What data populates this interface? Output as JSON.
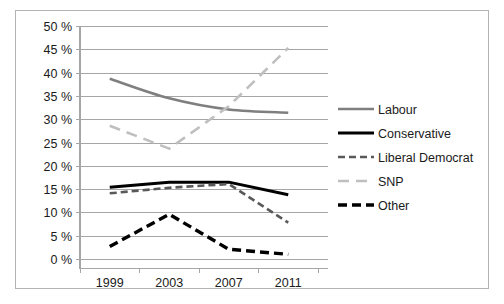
{
  "chart_data": {
    "type": "line",
    "title": "",
    "subtitle": "",
    "xlabel": "",
    "ylabel": "",
    "categories": [
      "1999",
      "2003",
      "2007",
      "2011"
    ],
    "x_tick_labels": [
      "1999",
      "2003",
      "2007",
      "2011"
    ],
    "y_tick_labels": [
      "0 %",
      "5 %",
      "10 %",
      "15 %",
      "20 %",
      "25 %",
      "30 %",
      "35 %",
      "40 %",
      "45 %",
      "50 %"
    ],
    "y_tick_values": [
      0,
      5,
      10,
      15,
      20,
      25,
      30,
      35,
      40,
      45,
      50
    ],
    "ylim": [
      0,
      50
    ],
    "y_tick_step": 5,
    "grid": "horizontal",
    "legend_position": "right",
    "series": [
      {
        "name": "Labour",
        "values": [
          38.8,
          34.6,
          32.2,
          31.5
        ],
        "color": "#7f7f7f",
        "style": "solid",
        "width": 2.6
      },
      {
        "name": "Conservative",
        "values": [
          15.5,
          16.6,
          16.6,
          13.9
        ],
        "color": "#000000",
        "style": "solid",
        "width": 3.0
      },
      {
        "name": "Liberal Democrat",
        "values": [
          14.2,
          15.4,
          16.2,
          7.9
        ],
        "color": "#595959",
        "style": "dashed",
        "width": 2.6
      },
      {
        "name": "SNP",
        "values": [
          28.7,
          23.8,
          32.9,
          45.4
        ],
        "color": "#bfbfbf",
        "style": "long-dashed",
        "width": 2.6
      },
      {
        "name": "Other",
        "values": [
          2.8,
          9.7,
          2.2,
          1.1
        ],
        "color": "#000000",
        "style": "thick-dashed",
        "width": 3.4
      }
    ],
    "legend_entries": [
      {
        "label": "Labour",
        "color": "#7f7f7f",
        "style": "solid"
      },
      {
        "label": "Conservative",
        "color": "#000000",
        "style": "solid"
      },
      {
        "label": "Liberal Democrat",
        "color": "#595959",
        "style": "dashed"
      },
      {
        "label": "SNP",
        "color": "#bfbfbf",
        "style": "long-dashed"
      },
      {
        "label": "Other",
        "color": "#000000",
        "style": "thick-dashed"
      }
    ]
  },
  "axes": {
    "y": {
      "labels": [
        "50 %",
        "45 %",
        "40 %",
        "35 %",
        "30 %",
        "25 %",
        "20 %",
        "15 %",
        "10 %",
        "5 %",
        "0 %"
      ]
    },
    "x": {
      "labels": [
        "1999",
        "2003",
        "2007",
        "2011"
      ]
    }
  },
  "legend": {
    "items": [
      {
        "label": "Labour"
      },
      {
        "label": "Conservative"
      },
      {
        "label": "Liberal Democrat"
      },
      {
        "label": "SNP"
      },
      {
        "label": "Other"
      }
    ]
  }
}
